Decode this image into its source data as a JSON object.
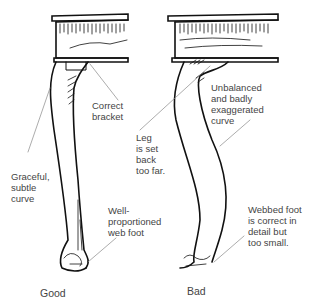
{
  "figure": {
    "good": {
      "caption": "Good",
      "labels": {
        "bracket": "Correct\nbracket",
        "curve": "Graceful,\nsubtle\ncurve",
        "foot": "Well-\nproportioned\nweb foot"
      }
    },
    "bad": {
      "caption": "Bad",
      "labels": {
        "curve": "Unbalanced\nand badly\nexaggerated\ncurve",
        "leg": "Leg\nis set\nback\ntoo far.",
        "foot": "Webbed foot\nis correct in\ndetail but\ntoo small."
      }
    }
  }
}
